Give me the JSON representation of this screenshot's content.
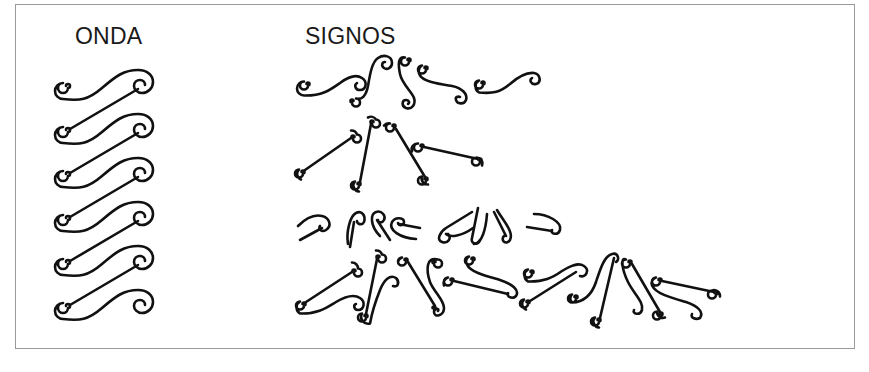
{
  "figure": {
    "labels": {
      "onda": "ONDA",
      "signos": "SIGNOS"
    },
    "colors": {
      "ink": "#111111",
      "frame": "#9a9a9a",
      "background": "#ffffff"
    },
    "onda": {
      "count": 6,
      "start_y": 86,
      "spacing": 44,
      "left_spiral_x": 68,
      "right_spiral_x": 142
    },
    "signos": {
      "rows": [
        {
          "name": "row-1-wave-fragments",
          "y": 85
        },
        {
          "name": "row-2-line-spirals",
          "y": 150
        },
        {
          "name": "row-3-hook-fragments",
          "y": 228
        },
        {
          "name": "row-4-mixed-signs",
          "y": 290
        }
      ]
    }
  }
}
